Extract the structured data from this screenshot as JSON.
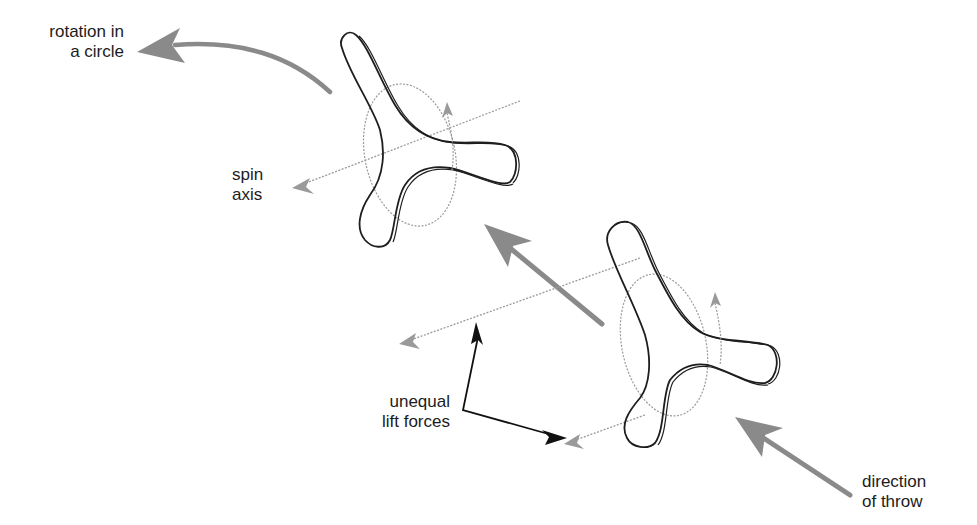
{
  "diagram": {
    "colors": {
      "outline": "#1e1e1e",
      "force_arrow": "#8a8a8a",
      "axis_line": "#9a9a9a",
      "pointer_arrow": "#111111",
      "background": "#ffffff"
    },
    "labels": {
      "rotation": "rotation in\na circle",
      "spin_axis": "spin\naxis",
      "lift": "unequal\nlift forces",
      "throw": "direction\nof throw"
    },
    "elements": [
      {
        "id": "boomerang-upper",
        "type": "three-blade boomerang outline",
        "center": [
          410,
          160
        ]
      },
      {
        "id": "boomerang-lower",
        "type": "three-blade boomerang outline",
        "center": [
          680,
          360
        ]
      },
      {
        "id": "rotation-arrow",
        "type": "curved gray arrow",
        "points_to": "rotation in a circle"
      },
      {
        "id": "spin-axis-upper",
        "type": "dashed axis arrow",
        "points_to": "spin axis"
      },
      {
        "id": "spin-axis-lower-top",
        "type": "dashed axis arrow"
      },
      {
        "id": "spin-axis-lower-bottom",
        "type": "dashed axis arrow"
      },
      {
        "id": "travel-arrow-middle",
        "type": "gray arrow",
        "direction": "up-left"
      },
      {
        "id": "throw-arrow",
        "type": "gray arrow",
        "direction": "up-left"
      },
      {
        "id": "lift-pointer-arrows",
        "type": "black pointer arrows",
        "from": "unequal lift forces"
      }
    ]
  }
}
